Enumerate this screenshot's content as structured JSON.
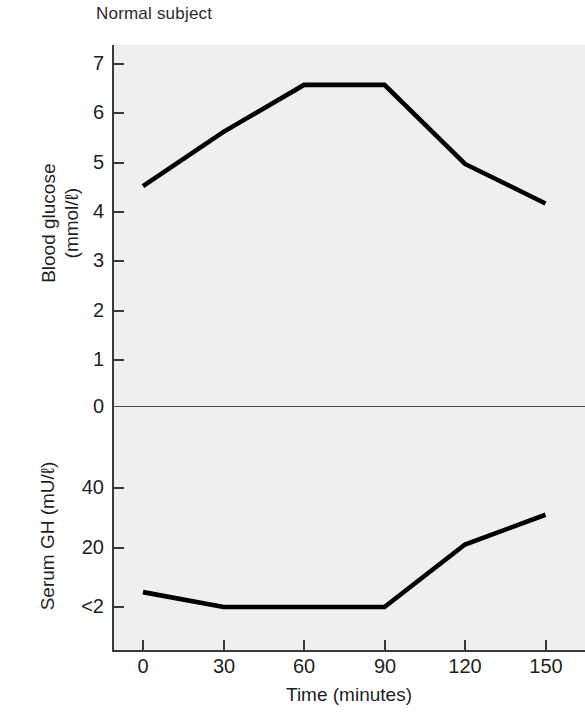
{
  "title": "Normal subject",
  "chart_data": {
    "type": "line",
    "title": "Normal subject",
    "xlabel": "Time (minutes)",
    "x": [
      0,
      30,
      60,
      90,
      120,
      150
    ],
    "xticklabels": [
      "0",
      "30",
      "60",
      "90",
      "120",
      "150"
    ],
    "xlim": [
      -12,
      162
    ],
    "grid": false,
    "legend": "none",
    "panels": [
      {
        "name": "blood-glucose",
        "ylabel_line1": "Blood glucose",
        "ylabel_line2": "(mmol/ℓ)",
        "ylabel": "Blood glucose (mmol/ℓ)",
        "units": "mmol/ℓ",
        "ylim": [
          0,
          7.4
        ],
        "yticks": [
          0,
          1,
          2,
          3,
          4,
          5,
          6,
          7
        ],
        "yticklabels": [
          "0",
          "1",
          "2",
          "3",
          "4",
          "5",
          "6",
          "7"
        ],
        "series": [
          {
            "name": "Blood glucose",
            "values": [
              4.45,
              5.55,
              6.5,
              6.5,
              4.9,
              4.1
            ]
          }
        ]
      },
      {
        "name": "serum-gh",
        "ylabel": "Serum GH (mU/ℓ)",
        "units": "mU/ℓ",
        "ylim": [
          0,
          48
        ],
        "yticks": [
          2,
          20,
          40
        ],
        "yticklabels": [
          "<2",
          "20",
          "40"
        ],
        "series": [
          {
            "name": "Serum GH",
            "values": [
              7,
              2,
              2,
              2,
              23,
              33
            ]
          }
        ]
      }
    ]
  },
  "style": {
    "panel_background": "#efefef",
    "line_color": "#000000",
    "axis_color": "#3a3a3a",
    "text_color": "#1f1f1f",
    "page_background": "#ffffff"
  }
}
